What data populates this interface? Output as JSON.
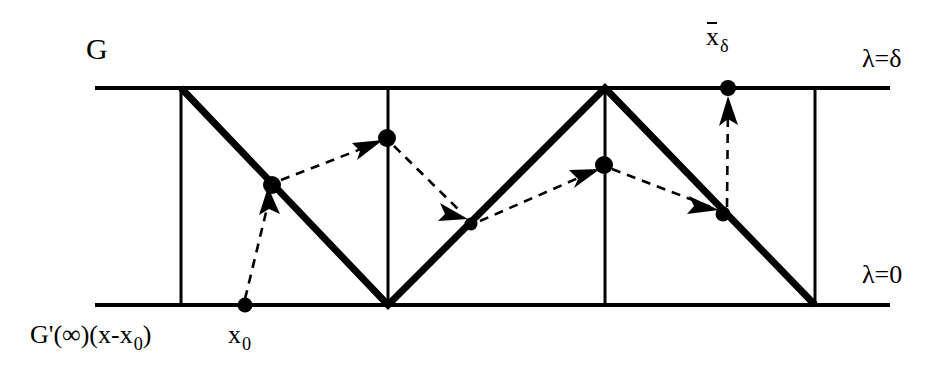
{
  "figure": {
    "kind": "mathematical-diagram",
    "width": 952,
    "height": 386,
    "background_color": "#ffffff",
    "stroke_color": "#000000"
  },
  "labels": {
    "g": "G",
    "lambda_delta": "λ=δ",
    "lambda_zero": "λ=0",
    "xbar_base": "x",
    "xbar_sub": "δ",
    "x0_base": "x",
    "x0_sub": "0",
    "gprime_formula_head": "G'(∞)(x-x",
    "gprime_formula_sub": "0",
    "gprime_formula_tail": ")"
  },
  "chart_data": {
    "type": "line",
    "title": "",
    "xlabel": "",
    "ylabel": "",
    "grid": false,
    "legend": null,
    "axis_lines": [
      {
        "name": "lambda-delta-line",
        "label": "λ=δ",
        "y": 88,
        "x_start": 95,
        "x_end": 890
      },
      {
        "name": "lambda-zero-line",
        "label": "λ=0",
        "y": 305,
        "x_start": 95,
        "x_end": 890
      }
    ],
    "vertical_lines": [
      {
        "name": "vline-1",
        "x": 181,
        "y_top": 88,
        "y_bottom": 305
      },
      {
        "name": "vline-2",
        "x": 388,
        "y_top": 88,
        "y_bottom": 305
      },
      {
        "name": "vline-3",
        "x": 605,
        "y_top": 88,
        "y_bottom": 305
      },
      {
        "name": "vline-4",
        "x": 815,
        "y_top": 88,
        "y_bottom": 305
      }
    ],
    "zigzag_path": [
      {
        "x": 181,
        "y": 88
      },
      {
        "x": 388,
        "y": 305
      },
      {
        "x": 605,
        "y": 88
      },
      {
        "x": 815,
        "y": 305
      }
    ],
    "points": [
      {
        "name": "x0",
        "x": 245,
        "y": 305,
        "label": "x₀",
        "on": "lambda-zero-line"
      },
      {
        "name": "iterate-1",
        "x": 272,
        "y": 185,
        "label": "",
        "on": "zigzag-descent-1"
      },
      {
        "name": "iterate-2",
        "x": 387,
        "y": 138,
        "label": "",
        "on": "vline-2"
      },
      {
        "name": "iterate-3",
        "x": 471,
        "y": 224,
        "label": "",
        "on": "zigzag-ascent-1"
      },
      {
        "name": "iterate-4",
        "x": 604,
        "y": 165,
        "label": "",
        "on": "vline-3"
      },
      {
        "name": "iterate-5",
        "x": 723,
        "y": 214,
        "label": "",
        "on": "zigzag-descent-2"
      },
      {
        "name": "xbar-delta",
        "x": 728,
        "y": 88,
        "label": "x̄_δ",
        "on": "lambda-delta-line"
      }
    ],
    "dashed_arrows": [
      {
        "name": "arrow-x0-to-iterate-1",
        "from": {
          "x": 245,
          "y": 299
        },
        "to": {
          "x": 268,
          "y": 192
        }
      },
      {
        "name": "arrow-iterate-1-to-iterate-2",
        "from": {
          "x": 281,
          "y": 180
        },
        "to": {
          "x": 379,
          "y": 142
        }
      },
      {
        "name": "arrow-iterate-2-to-iterate-3",
        "from": {
          "x": 394,
          "y": 146
        },
        "to": {
          "x": 466,
          "y": 217
        }
      },
      {
        "name": "arrow-iterate-3-to-iterate-4",
        "from": {
          "x": 480,
          "y": 221
        },
        "to": {
          "x": 596,
          "y": 170
        }
      },
      {
        "name": "arrow-iterate-4-to-iterate-5",
        "from": {
          "x": 612,
          "y": 169
        },
        "to": {
          "x": 716,
          "y": 209
        }
      },
      {
        "name": "arrow-iterate-5-to-xbar-delta",
        "from": {
          "x": 726,
          "y": 207
        },
        "to": {
          "x": 728,
          "y": 96
        }
      }
    ]
  }
}
